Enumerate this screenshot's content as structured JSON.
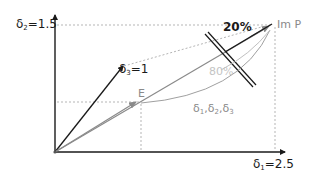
{
  "diagram": {
    "type": "vector-geometry",
    "axes": {
      "x_label_symbol": "δ",
      "x_label_sub": "1",
      "x_label_value": "=2.5",
      "y_label_symbol": "δ",
      "y_label_sub": "2",
      "y_label_value": "=1.5"
    },
    "vectors": {
      "d3_symbol": "δ",
      "d3_sub": "3",
      "d3_value": "=1",
      "e_label": "E",
      "imp_label": "Im P"
    },
    "annotations": {
      "pct_top": "20%",
      "pct_mid": "80%",
      "arc_label_symbol": "δ",
      "arc_label_subs": [
        "1",
        "2",
        "3"
      ]
    },
    "colors": {
      "black": "#1a1a1a",
      "gray": "#8a8a8a",
      "light_gray": "#bdbdbd",
      "dashed": "#b0b0b0"
    }
  }
}
